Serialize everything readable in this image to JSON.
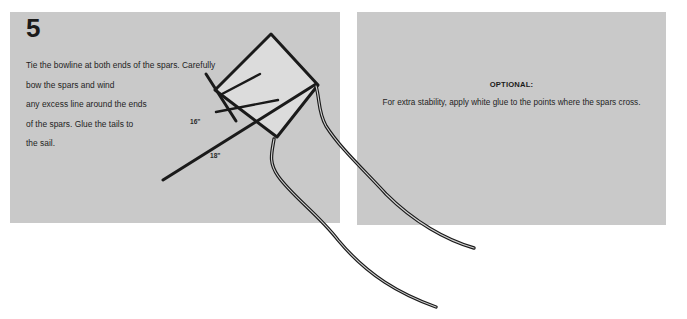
{
  "document": {
    "title": "Kite Assembly Instructions - Step 5"
  },
  "step": {
    "number": "5",
    "instructions": "Tie the bowline at both ends of the spars. Carefully\nbow the spars and wind\nany excess line around the ends\nof the spars. Glue the tails to\nthe sail."
  },
  "optional_note": {
    "label": "OPTIONAL:",
    "body": "For extra stability, apply white glue to the points where the spars cross."
  },
  "diagram": {
    "dimensions": [
      {
        "value": "16\"",
        "x": 190,
        "y": 124
      },
      {
        "value": "18\"",
        "x": 210,
        "y": 158
      }
    ],
    "parts": {
      "sail": "kite-sail",
      "spar_vertical": "vertical-spar",
      "spar_horizontal": "horizontal-spar",
      "bowline": "bowline-string",
      "tail_one": "tail-streamer-1",
      "tail_two": "tail-streamer-2"
    }
  },
  "colors": {
    "panel_gray": "#c9c9c9",
    "sail_fill": "#dcdcdc",
    "line_dark": "#1a1a1a",
    "text_dark": "#1e1e1e",
    "page_background": "#ffffff"
  }
}
